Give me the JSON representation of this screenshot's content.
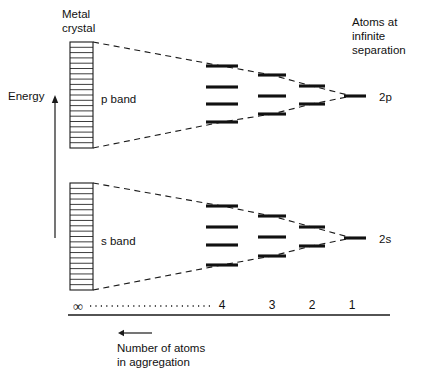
{
  "figure": {
    "title_labels": {
      "metal_crystal": [
        "Metal",
        "crystal"
      ],
      "atoms_infinite": [
        "Atoms at",
        "infinite",
        "separation"
      ],
      "energy": "Energy",
      "axis_caption": [
        "Number of atoms",
        "in aggregation"
      ],
      "p_band": "p band",
      "s_band": "s band",
      "atomic_p": "2p",
      "atomic_s": "2s",
      "infinity": "∞"
    },
    "axis": {
      "ticks": [
        "4",
        "3",
        "2",
        "1"
      ],
      "tick_x": [
        222,
        272,
        312,
        352
      ],
      "tick_label_y": 309,
      "line_y": 315,
      "line_x0": 68,
      "line_x1": 390,
      "dotted_y": 306,
      "dotted_x0": 90,
      "dotted_x1": 212,
      "infinity_x": 78,
      "infinity_y": 311,
      "direction_arrow": {
        "x_tip": 118,
        "x_tail": 152,
        "y": 333
      }
    },
    "energy_arrow": {
      "x": 55,
      "y_bottom": 238,
      "y_top": 95,
      "label_x": 8,
      "label_y": 100
    },
    "crystal_blocks": [
      {
        "name": "p",
        "x": 70,
        "y": 42,
        "width": 23,
        "height": 106,
        "rows": 20
      },
      {
        "name": "s",
        "x": 70,
        "y": 183,
        "width": 23,
        "height": 107,
        "rows": 20
      }
    ],
    "bands": [
      {
        "name": "p band",
        "label_x": 101,
        "label_y": 103,
        "envelope_top": [
          [
            93,
            42
          ],
          [
            222,
            66
          ],
          [
            272,
            75
          ],
          [
            312,
            86
          ],
          [
            352,
            96
          ]
        ],
        "envelope_bottom": [
          [
            93,
            148
          ],
          [
            222,
            122
          ],
          [
            272,
            114
          ],
          [
            312,
            104
          ],
          [
            352,
            96
          ]
        ],
        "columns": [
          {
            "n": "4",
            "cx": 222,
            "half_width": 16,
            "levels": [
              66,
              87,
              104,
              122
            ]
          },
          {
            "n": "3",
            "cx": 272,
            "half_width": 14,
            "levels": [
              75,
              96,
              114
            ]
          },
          {
            "n": "2",
            "cx": 312,
            "half_width": 13,
            "levels": [
              86,
              104
            ]
          },
          {
            "n": "1",
            "cx": 355,
            "half_width": 11,
            "levels": [
              96
            ]
          }
        ],
        "atomic_label": "2p",
        "atomic_label_x": 379,
        "atomic_label_y": 101
      },
      {
        "name": "s band",
        "label_x": 101,
        "label_y": 245,
        "envelope_top": [
          [
            93,
            183
          ],
          [
            222,
            206
          ],
          [
            272,
            216
          ],
          [
            312,
            227
          ],
          [
            352,
            238
          ]
        ],
        "envelope_bottom": [
          [
            93,
            290
          ],
          [
            222,
            265
          ],
          [
            272,
            256
          ],
          [
            312,
            246
          ],
          [
            352,
            238
          ]
        ],
        "columns": [
          {
            "n": "4",
            "cx": 222,
            "half_width": 16,
            "levels": [
              206,
              227,
              245,
              265
            ]
          },
          {
            "n": "3",
            "cx": 272,
            "half_width": 14,
            "levels": [
              216,
              237,
              256
            ]
          },
          {
            "n": "2",
            "cx": 312,
            "half_width": 13,
            "levels": [
              227,
              246
            ]
          },
          {
            "n": "1",
            "cx": 355,
            "half_width": 11,
            "levels": [
              238
            ]
          }
        ],
        "atomic_label": "2s",
        "atomic_label_x": 379,
        "atomic_label_y": 243
      }
    ],
    "text_blocks": {
      "metal_crystal_x": 62,
      "metal_crystal_y": 18,
      "atoms_infinite_x": 352,
      "atoms_infinite_y": 26,
      "caption_x": 117,
      "caption_y": 352,
      "line_height": 14
    },
    "colors": {
      "ink": "#111111",
      "background": "#ffffff"
    }
  },
  "chart_data": {
    "type": "diagram",
    "xlabel": "Number of atoms in aggregation",
    "ylabel": "Energy",
    "x_tick_labels": [
      "∞",
      "4",
      "3",
      "2",
      "1"
    ],
    "series": [
      {
        "name": "p band",
        "atomic_level": "2p",
        "level_counts": [
          1,
          2,
          3,
          4
        ],
        "note": "As atom count increases from 1 to ∞, discrete 2p levels split and broaden into a continuous p band."
      },
      {
        "name": "s band",
        "atomic_level": "2s",
        "level_counts": [
          1,
          2,
          3,
          4
        ],
        "note": "As atom count increases from 1 to ∞, discrete 2s levels split and broaden into a continuous s band."
      }
    ],
    "annotations": [
      "Metal crystal",
      "Atoms at infinite separation"
    ]
  }
}
